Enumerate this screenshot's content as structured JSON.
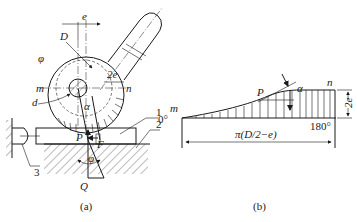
{
  "figure_a": {
    "caption": "(a)",
    "labels": {
      "e": "e",
      "D": "D",
      "phi_top": "φ",
      "two_e": "2e",
      "m": "m",
      "n": "n",
      "d": "d",
      "alpha": "α",
      "P": "P",
      "F": "F",
      "phi_bottom": "φ",
      "Q": "Q"
    },
    "part_numbers": [
      "1",
      "2",
      "3"
    ]
  },
  "figure_b": {
    "caption": "(b)",
    "labels": {
      "m": "m",
      "n": "n",
      "P": "P",
      "alpha": "α",
      "two_e": "2e",
      "start_angle": "0°",
      "end_angle": "180°",
      "length": "π(D/2−e)"
    }
  }
}
